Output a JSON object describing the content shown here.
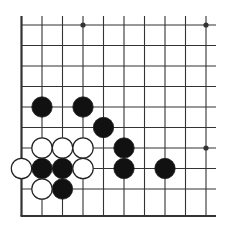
{
  "diagram": {
    "type": "go-board-fragment",
    "corner": "bottom-left",
    "columns": 10,
    "rows": 10,
    "colors": {
      "background": "#ffffff",
      "line": "#333333",
      "black_stone": "#111111",
      "white_stone": "#ffffff",
      "stone_outline": "#222222"
    },
    "star_points": [
      {
        "col": 3,
        "row": 0
      },
      {
        "col": 9,
        "row": 0
      },
      {
        "col": 9,
        "row": 6
      }
    ],
    "stones": [
      {
        "color": "black",
        "col": 1,
        "row": 4
      },
      {
        "color": "black",
        "col": 3,
        "row": 4
      },
      {
        "color": "black",
        "col": 4,
        "row": 5
      },
      {
        "color": "white",
        "col": 1,
        "row": 6
      },
      {
        "color": "white",
        "col": 2,
        "row": 6
      },
      {
        "color": "white",
        "col": 3,
        "row": 6
      },
      {
        "color": "black",
        "col": 5,
        "row": 6
      },
      {
        "color": "white",
        "col": 0,
        "row": 7
      },
      {
        "color": "black",
        "col": 1,
        "row": 7
      },
      {
        "color": "black",
        "col": 2,
        "row": 7
      },
      {
        "color": "white",
        "col": 3,
        "row": 7
      },
      {
        "color": "black",
        "col": 5,
        "row": 7
      },
      {
        "color": "black",
        "col": 7,
        "row": 7
      },
      {
        "color": "white",
        "col": 1,
        "row": 8
      },
      {
        "color": "black",
        "col": 2,
        "row": 8
      }
    ]
  }
}
